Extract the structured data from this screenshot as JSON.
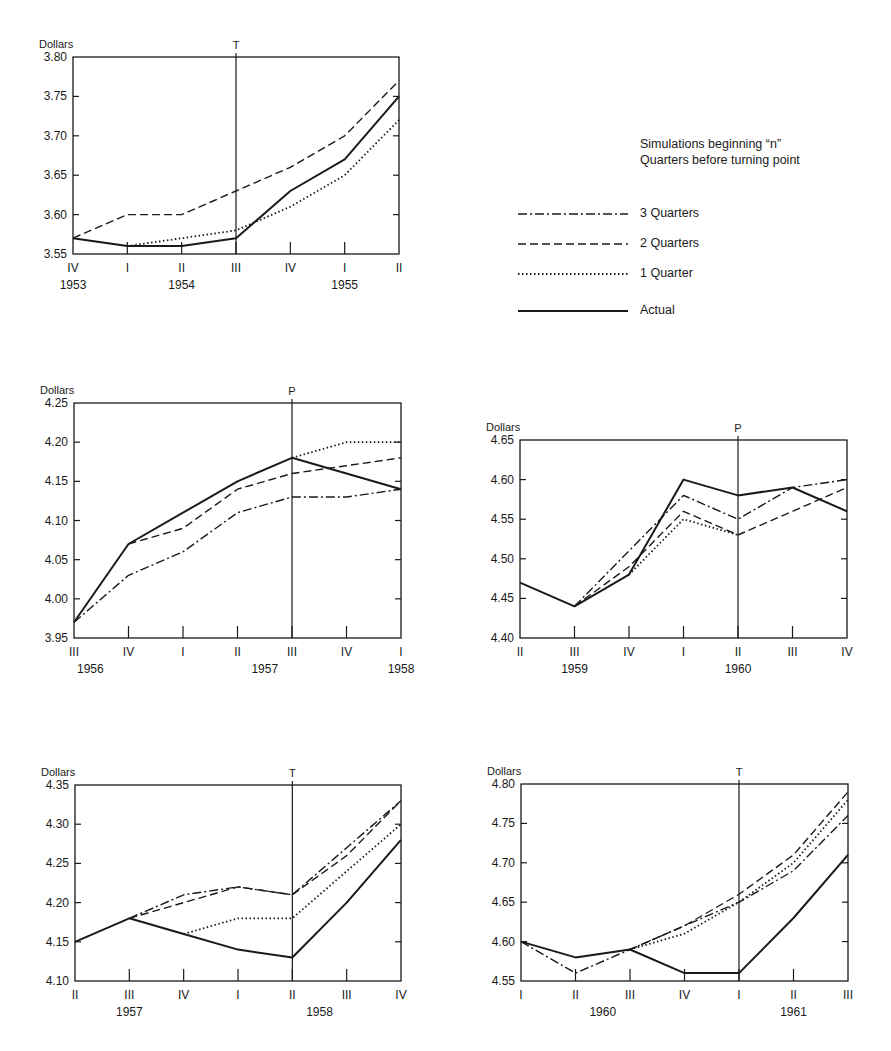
{
  "legend": {
    "title_line1": "Simulations beginning “n”",
    "title_line2": "Quarters before turning point",
    "items": [
      {
        "label": "3 Quarters",
        "style": "dashdot"
      },
      {
        "label": "2 Quarters",
        "style": "dashed"
      },
      {
        "label": "1 Quarter",
        "style": "dotted"
      },
      {
        "label": "Actual",
        "style": "solid"
      }
    ]
  },
  "chart_data": [
    {
      "type": "line",
      "title": "",
      "ylabel": "Dollars",
      "ylim": [
        3.55,
        3.8
      ],
      "yticks": [
        "3.55",
        "3.60",
        "3.65",
        "3.70",
        "3.75",
        "3.80"
      ],
      "categories": [
        "IV",
        "I",
        "II",
        "III",
        "IV",
        "I",
        "II"
      ],
      "years": [
        {
          "label": "1953",
          "at": 0
        },
        {
          "label": "1954",
          "at": 2
        },
        {
          "label": "1955",
          "at": 5
        }
      ],
      "turning_point": {
        "label": "T",
        "at": 3
      },
      "series": [
        {
          "name": "Actual",
          "values": [
            3.57,
            3.56,
            3.56,
            3.57,
            3.63,
            3.67,
            3.75
          ]
        },
        {
          "name": "2 Quarters",
          "values": [
            3.57,
            3.6,
            3.6,
            3.63,
            3.66,
            3.7,
            3.77
          ]
        },
        {
          "name": "1 Quarter",
          "values": [
            null,
            3.56,
            3.57,
            3.58,
            3.61,
            3.65,
            3.72
          ]
        }
      ]
    },
    {
      "type": "line",
      "ylabel": "Dollars",
      "ylim": [
        3.95,
        4.25
      ],
      "yticks": [
        "3.95",
        "4.00",
        "4.05",
        "4.10",
        "4.15",
        "4.20",
        "4.25"
      ],
      "categories": [
        "III",
        "IV",
        "I",
        "II",
        "III",
        "IV",
        "I"
      ],
      "years": [
        {
          "label": "1956",
          "at": 0.3
        },
        {
          "label": "1957",
          "at": 3.5
        },
        {
          "label": "1958",
          "at": 6
        }
      ],
      "turning_point": {
        "label": "P",
        "at": 4
      },
      "series": [
        {
          "name": "Actual",
          "values": [
            3.97,
            4.07,
            4.11,
            4.15,
            4.18,
            4.16,
            4.14
          ]
        },
        {
          "name": "3 Quarters",
          "values": [
            3.97,
            4.03,
            4.06,
            4.11,
            4.13,
            4.13,
            4.14
          ]
        },
        {
          "name": "2 Quarters",
          "values": [
            null,
            4.07,
            4.09,
            4.14,
            4.16,
            4.17,
            4.18
          ]
        },
        {
          "name": "1 Quarter",
          "values": [
            null,
            null,
            null,
            null,
            4.18,
            4.2,
            4.2
          ]
        }
      ]
    },
    {
      "type": "line",
      "ylabel": "Dollars",
      "ylim": [
        4.4,
        4.65
      ],
      "yticks": [
        "4.40",
        "4.45",
        "4.50",
        "4.55",
        "4.60",
        "4.65"
      ],
      "categories": [
        "II",
        "III",
        "IV",
        "I",
        "II",
        "III",
        "IV"
      ],
      "years": [
        {
          "label": "1959",
          "at": 1
        },
        {
          "label": "1960",
          "at": 4
        }
      ],
      "turning_point": {
        "label": "P",
        "at": 4
      },
      "series": [
        {
          "name": "Actual",
          "values": [
            4.47,
            4.44,
            4.48,
            4.6,
            4.58,
            4.59,
            4.56
          ]
        },
        {
          "name": "3 Quarters",
          "values": [
            null,
            4.44,
            4.51,
            4.58,
            4.55,
            4.59,
            4.6
          ]
        },
        {
          "name": "2 Quarters",
          "values": [
            null,
            4.44,
            4.49,
            4.56,
            4.53,
            4.56,
            4.59
          ]
        },
        {
          "name": "1 Quarter",
          "values": [
            null,
            null,
            4.48,
            4.55,
            4.53,
            null,
            null
          ]
        }
      ]
    },
    {
      "type": "line",
      "ylabel": "Dollars",
      "ylim": [
        4.1,
        4.35
      ],
      "yticks": [
        "4.10",
        "4.15",
        "4.20",
        "4.25",
        "4.30",
        "4.35"
      ],
      "categories": [
        "II",
        "III",
        "IV",
        "I",
        "II",
        "III",
        "IV"
      ],
      "years": [
        {
          "label": "1957",
          "at": 1
        },
        {
          "label": "1958",
          "at": 4.5
        }
      ],
      "turning_point": {
        "label": "T",
        "at": 4
      },
      "series": [
        {
          "name": "Actual",
          "values": [
            4.15,
            4.18,
            4.16,
            4.14,
            4.13,
            4.2,
            4.28
          ]
        },
        {
          "name": "3 Quarters",
          "values": [
            null,
            4.18,
            4.21,
            4.22,
            4.21,
            4.27,
            4.33
          ]
        },
        {
          "name": "2 Quarters",
          "values": [
            null,
            4.18,
            4.2,
            4.22,
            4.21,
            4.26,
            4.33
          ]
        },
        {
          "name": "1 Quarter",
          "values": [
            null,
            null,
            4.16,
            4.18,
            4.18,
            4.24,
            4.3
          ]
        }
      ]
    },
    {
      "type": "line",
      "ylabel": "Dollars",
      "ylim": [
        4.55,
        4.8
      ],
      "yticks": [
        "4.55",
        "4.60",
        "4.65",
        "4.70",
        "4.75",
        "4.80"
      ],
      "categories": [
        "I",
        "II",
        "III",
        "IV",
        "I",
        "II",
        "III"
      ],
      "years": [
        {
          "label": "1960",
          "at": 1.5
        },
        {
          "label": "1961",
          "at": 5
        }
      ],
      "turning_point": {
        "label": "T",
        "at": 4
      },
      "series": [
        {
          "name": "Actual",
          "values": [
            4.6,
            4.58,
            4.59,
            4.56,
            4.56,
            4.63,
            4.71
          ]
        },
        {
          "name": "3 Quarters",
          "values": [
            4.6,
            4.56,
            4.59,
            4.62,
            4.65,
            4.69,
            4.76
          ]
        },
        {
          "name": "2 Quarters",
          "values": [
            null,
            null,
            4.59,
            4.62,
            4.66,
            4.71,
            4.79
          ]
        },
        {
          "name": "1 Quarter",
          "values": [
            null,
            null,
            4.59,
            4.61,
            4.65,
            4.7,
            4.78
          ]
        }
      ]
    }
  ]
}
